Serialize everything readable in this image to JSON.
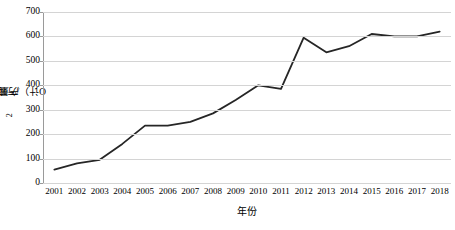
{
  "chart_data": {
    "type": "line",
    "title": "",
    "xlabel": "年份",
    "ylabel": "产量（以K2O计）/万吨",
    "ylabel_parts": {
      "prefix": "产量（以K",
      "sub": "2",
      "suffix": "O计）/万吨"
    },
    "categories": [
      "2001",
      "2002",
      "2003",
      "2004",
      "2005",
      "2006",
      "2007",
      "2008",
      "2009",
      "2010",
      "2011",
      "2012",
      "2013",
      "2014",
      "2015",
      "2016",
      "2017",
      "2018"
    ],
    "x": [
      2001,
      2002,
      2003,
      2004,
      2005,
      2006,
      2007,
      2008,
      2009,
      2010,
      2011,
      2012,
      2013,
      2014,
      2015,
      2016,
      2017,
      2018
    ],
    "values": [
      55,
      80,
      95,
      160,
      235,
      235,
      250,
      285,
      340,
      400,
      385,
      595,
      535,
      560,
      610,
      600,
      600,
      620
    ],
    "series": [
      {
        "name": "产量（以K2O计）/万吨",
        "values": [
          55,
          80,
          95,
          160,
          235,
          235,
          250,
          285,
          340,
          400,
          385,
          595,
          535,
          560,
          610,
          600,
          600,
          620
        ],
        "color": "#262626"
      }
    ],
    "ylim": [
      0,
      700
    ],
    "ytick_values": [
      0,
      100,
      200,
      300,
      400,
      500,
      600,
      700
    ],
    "ytick_labels": [
      "0",
      "100",
      "200",
      "300",
      "400",
      "500",
      "600",
      "700"
    ],
    "grid": true,
    "grid_axis": "y",
    "grid_color": "#d4d4d4",
    "legend": false,
    "legend_position": "none",
    "line_color": "#262626",
    "line_width": 1.8,
    "markers": false,
    "background_color": "#ffffff",
    "axis_color": "#9a9a9a"
  }
}
